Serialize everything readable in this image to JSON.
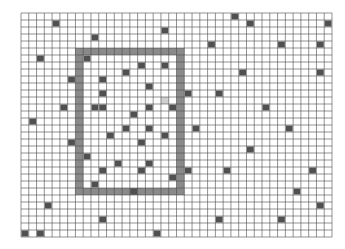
{
  "grid": {
    "origin_x": 21,
    "origin_y": 13,
    "cols": 40,
    "rows": 32,
    "cell_w": 7.775,
    "cell_h": 7,
    "line_color": "#4a4a4a",
    "background": "#ffffff"
  },
  "colors": {
    "filled_cell": "#505050",
    "frame": "#8a8a8a",
    "highlight_cell": "#cfcfcf"
  },
  "frame": {
    "col_start": 7,
    "row_start": 5,
    "col_end": 20,
    "row_end": 25
  },
  "highlight_cells": [
    [
      18,
      12
    ]
  ],
  "filled_cells": [
    [
      4,
      1
    ],
    [
      9,
      3
    ],
    [
      18,
      2
    ],
    [
      27,
      0
    ],
    [
      29,
      1
    ],
    [
      39,
      1
    ],
    [
      24,
      4
    ],
    [
      33,
      4
    ],
    [
      38,
      4
    ],
    [
      2,
      6
    ],
    [
      8,
      6
    ],
    [
      15,
      7
    ],
    [
      18,
      7
    ],
    [
      28,
      8
    ],
    [
      38,
      8
    ],
    [
      6,
      9
    ],
    [
      13,
      8
    ],
    [
      10,
      9
    ],
    [
      16,
      10
    ],
    [
      10,
      11
    ],
    [
      21,
      11
    ],
    [
      25,
      11
    ],
    [
      5,
      13
    ],
    [
      9,
      13
    ],
    [
      10,
      13
    ],
    [
      16,
      13
    ],
    [
      19,
      13
    ],
    [
      31,
      13
    ],
    [
      14,
      14
    ],
    [
      1,
      15
    ],
    [
      13,
      16
    ],
    [
      16,
      16
    ],
    [
      22,
      16
    ],
    [
      34,
      16
    ],
    [
      11,
      17
    ],
    [
      18,
      17
    ],
    [
      6,
      18
    ],
    [
      15,
      18
    ],
    [
      29,
      19
    ],
    [
      8,
      20
    ],
    [
      12,
      21
    ],
    [
      16,
      21
    ],
    [
      10,
      22
    ],
    [
      15,
      22
    ],
    [
      21,
      22
    ],
    [
      26,
      22
    ],
    [
      37,
      22
    ],
    [
      19,
      23
    ],
    [
      9,
      24
    ],
    [
      14,
      25
    ],
    [
      35,
      25
    ],
    [
      3,
      27
    ],
    [
      38,
      27
    ],
    [
      10,
      29
    ],
    [
      25,
      29
    ],
    [
      33,
      29
    ],
    [
      2,
      31
    ],
    [
      17,
      31
    ],
    [
      0,
      31
    ]
  ]
}
